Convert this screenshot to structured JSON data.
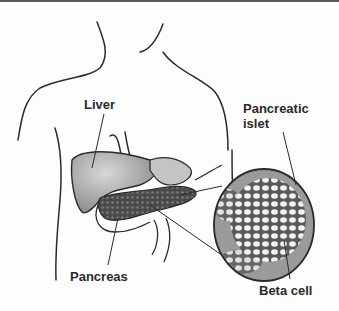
{
  "diagram": {
    "type": "anatomical-illustration",
    "labels": {
      "liver": "Liver",
      "pancreatic_islet_line1": "Pancreatic",
      "pancreatic_islet_line2": "islet",
      "pancreas": "Pancreas",
      "beta_cell": "Beta cell"
    },
    "colors": {
      "line": "#2a2a2a",
      "organ_fill": "#b8b8b8",
      "pancreas_fill": "#5c5c5c",
      "islet_fill": "#e8e8e8",
      "border": "#5a5a5a"
    }
  }
}
